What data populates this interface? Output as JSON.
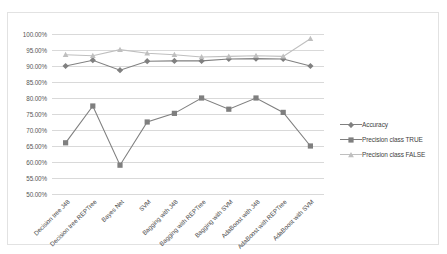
{
  "chart_data": {
    "type": "line",
    "title": "",
    "xlabel": "",
    "ylabel": "",
    "ylim": [
      50,
      100
    ],
    "ytick_step": 5,
    "grid": true,
    "legend_position": "right",
    "ytick_labels": [
      "100.00%",
      "95.00%",
      "90.00%",
      "85.00%",
      "80.00%",
      "75.00%",
      "70.00%",
      "65.00%",
      "60.00%",
      "55.00%",
      "50.00%"
    ],
    "categories": [
      "Decision tree J48",
      "Decision tree REPTree",
      "Bayes Net",
      "SVM",
      "Bagging with J48",
      "Bagging with REPTree",
      "Bagging with SVM",
      "AdaBoost with J48",
      "AdaBoost with REPTree",
      "AdaBoost with SVM"
    ],
    "series": [
      {
        "name": "Accuracy",
        "marker": "diamond",
        "color": "#808080",
        "values": [
          90.0,
          91.8,
          88.7,
          91.5,
          91.6,
          91.6,
          92.2,
          92.3,
          92.2,
          90.0
        ]
      },
      {
        "name": "Precision class TRUE",
        "marker": "square",
        "color": "#7f7f7f",
        "values": [
          66.0,
          77.5,
          59.0,
          72.5,
          75.2,
          80.0,
          76.5,
          80.0,
          75.5,
          65.0
        ]
      },
      {
        "name": "Precision class FALSE",
        "marker": "triangle",
        "color": "#bfbfbf",
        "values": [
          93.5,
          93.2,
          95.1,
          94.0,
          93.5,
          92.8,
          93.0,
          93.2,
          93.0,
          98.5
        ]
      }
    ]
  },
  "legend": {
    "entries": [
      {
        "label": "Accuracy"
      },
      {
        "label": "Precision class TRUE"
      },
      {
        "label": "Precision class FALSE"
      }
    ]
  }
}
